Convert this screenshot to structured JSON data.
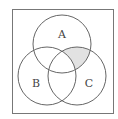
{
  "diagram": {
    "type": "venn",
    "universe": {
      "x": 12,
      "y": 9,
      "w": 101,
      "h": 104,
      "stroke": "#777777"
    },
    "sets": [
      {
        "label": "A",
        "cx": 62,
        "cy": 44,
        "r": 29,
        "label_x": 62,
        "label_y": 35
      },
      {
        "label": "B",
        "cx": 47,
        "cy": 76,
        "r": 29,
        "label_x": 36,
        "label_y": 84
      },
      {
        "label": "C",
        "cx": 77,
        "cy": 76,
        "r": 29,
        "label_x": 89,
        "label_y": 84
      }
    ],
    "shaded_region": "A ∩ C − B",
    "shade_color": "#e2e2e2",
    "stroke_color": "#666666"
  }
}
